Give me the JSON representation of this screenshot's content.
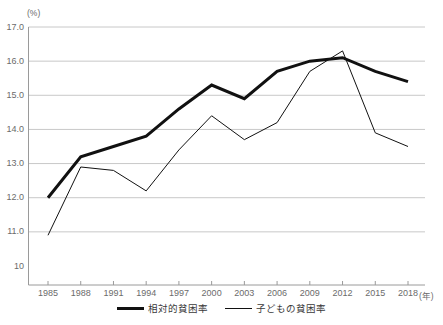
{
  "chart_data": {
    "type": "line",
    "title": "",
    "xlabel": "年",
    "ylabel": "(%)",
    "unit_label": "(%)",
    "xaxis_unit_label": "(年)",
    "x": [
      1985,
      1988,
      1991,
      1994,
      1997,
      2000,
      2003,
      2006,
      2009,
      2012,
      2015,
      2018
    ],
    "categories": [
      "1985",
      "1988",
      "1991",
      "1994",
      "1997",
      "2000",
      "2003",
      "2006",
      "2009",
      "2012",
      "2015",
      "2018"
    ],
    "series": [
      {
        "name": "相対的貧困率",
        "style": "bold",
        "color": "#111111",
        "values": [
          12.0,
          13.2,
          13.5,
          13.8,
          14.6,
          15.3,
          14.9,
          15.7,
          16.0,
          16.1,
          15.7,
          15.4
        ]
      },
      {
        "name": "子どもの貧困率",
        "style": "thin",
        "color": "#111111",
        "values": [
          10.9,
          12.9,
          12.8,
          12.2,
          13.4,
          14.4,
          13.7,
          14.2,
          15.7,
          16.3,
          13.9,
          13.5
        ]
      }
    ],
    "ylim": [
      10.0,
      17.0
    ],
    "ytick_values": [
      17.0,
      16.0,
      15.0,
      14.0,
      13.0,
      12.0,
      11.0,
      10.0
    ],
    "ytick_labels": [
      "17.0",
      "16.0",
      "15.0",
      "14.0",
      "13.0",
      "12.0",
      "11.0",
      "10"
    ],
    "grid": true,
    "grid_color": "#c8c8c8",
    "axis_color": "#9a9a9a",
    "legend_position": "bottom",
    "legend": [
      "相対的貧困率",
      "子どもの貧困率"
    ]
  }
}
